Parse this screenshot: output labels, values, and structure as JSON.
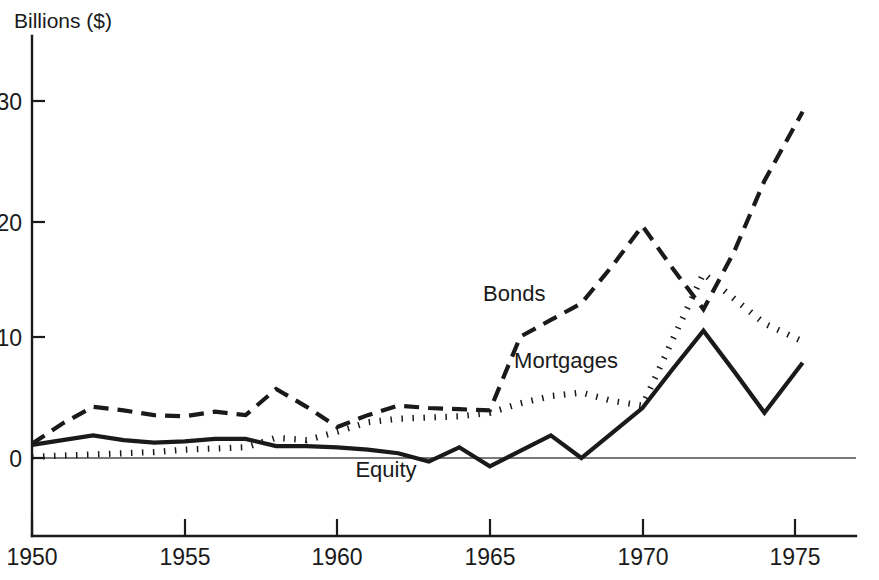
{
  "chart_data": {
    "type": "line",
    "title": "",
    "ylabel": "Billions ($)",
    "xlabel": "",
    "ylim": [
      -2,
      34
    ],
    "xlim": [
      1950,
      1975.5
    ],
    "grid": false,
    "legend": "inline-annotations",
    "yticks": [
      0,
      10,
      20,
      30
    ],
    "ytick_labels": [
      "0",
      "10",
      "20",
      "30"
    ],
    "xticks": [
      1950,
      1955,
      1960,
      1965,
      1970,
      1975
    ],
    "xtick_labels": [
      "1950",
      "1955",
      "1960",
      "1965",
      "1970",
      "1975"
    ],
    "x": [
      1950,
      1951,
      1952,
      1953,
      1954,
      1955,
      1956,
      1957,
      1958,
      1959,
      1960,
      1961,
      1962,
      1963,
      1964,
      1965,
      1966,
      1967,
      1968,
      1969,
      1970,
      1971,
      1972,
      1973,
      1974,
      1975.25
    ],
    "series": [
      {
        "name": "Bonds",
        "style": "dashed",
        "color": "#1a1a1a",
        "values": [
          1.2,
          2.9,
          4.3,
          4.0,
          3.6,
          3.5,
          3.9,
          3.6,
          5.8,
          4.3,
          2.6,
          3.6,
          4.4,
          4.2,
          4.1,
          4.0,
          10.2,
          11.6,
          13.0,
          16.1,
          19.5,
          15.9,
          12.5,
          17.3,
          23.3,
          29.1
        ]
      },
      {
        "name": "Mortgages",
        "style": "dotted",
        "color": "#1a1a1a",
        "values": [
          0.1,
          0.2,
          0.3,
          0.4,
          0.5,
          0.7,
          0.8,
          0.9,
          1.7,
          1.5,
          2.2,
          3.0,
          3.3,
          3.4,
          3.5,
          3.8,
          4.6,
          5.2,
          5.5,
          4.8,
          4.4,
          10.0,
          15.5,
          13.4,
          11.3,
          9.8
        ]
      },
      {
        "name": "Equity",
        "style": "solid",
        "color": "#1a1a1a",
        "values": [
          1.1,
          1.5,
          1.9,
          1.5,
          1.3,
          1.4,
          1.6,
          1.6,
          1.0,
          1.0,
          0.9,
          0.7,
          0.4,
          -0.3,
          0.9,
          -0.7,
          0.6,
          1.9,
          0.0,
          2.1,
          4.2,
          7.5,
          10.7,
          7.3,
          3.8,
          8.0
        ]
      }
    ],
    "annotations": [
      {
        "text": "Bonds",
        "x": 1965.8,
        "y": 13.2
      },
      {
        "text": "Mortgages",
        "x": 1967.5,
        "y": 7.6
      },
      {
        "text": "Equity",
        "x": 1961.6,
        "y": -1.6
      }
    ]
  },
  "labels": {
    "y_axis_caption": "Billions ($)",
    "bonds": "Bonds",
    "mortgages": "Mortgages",
    "equity": "Equity",
    "y_0": "0",
    "y_10": "10",
    "y_20": "20",
    "y_30": "30",
    "x_1950": "1950",
    "x_1955": "1955",
    "x_1960": "1960",
    "x_1965": "1965",
    "x_1970": "1970",
    "x_1975": "1975"
  }
}
